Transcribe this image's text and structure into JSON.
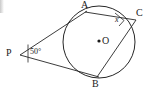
{
  "figure": {
    "type": "circle-geometry-tangent-inscribed-angle",
    "width": 145,
    "height": 92,
    "background": "#ffffff",
    "stroke_color": "#262626",
    "text_color": "#1a1a1a"
  },
  "labels": {
    "point_a": "A",
    "point_b": "B",
    "point_c": "C",
    "center_o": "O",
    "point_p": "P",
    "angle_p": "50°",
    "angle_c": "x"
  },
  "geometry": {
    "circle": {
      "cx": 99,
      "cy": 42,
      "r": 36
    },
    "points": {
      "A": {
        "x": 85,
        "y": 12
      },
      "B": {
        "x": 97,
        "y": 77
      },
      "C": {
        "x": 134,
        "y": 20
      },
      "O": {
        "x": 99,
        "y": 42
      },
      "P": {
        "x": 20,
        "y": 55
      }
    },
    "segments": [
      {
        "name": "tangent-p-to-a",
        "from": "P",
        "to": "A"
      },
      {
        "name": "tangent-p-to-b",
        "from": "P",
        "to": "B"
      },
      {
        "name": "chord-a-to-c",
        "from": "A",
        "to": "C"
      },
      {
        "name": "chord-b-to-c",
        "from": "B",
        "to": "C"
      }
    ],
    "angle_markers": [
      {
        "name": "angle-at-p",
        "vertex": "P",
        "value": "50°"
      },
      {
        "name": "angle-at-c",
        "vertex": "C",
        "value": "x"
      }
    ]
  },
  "label_positions": {
    "A": {
      "left": 81,
      "top": 0
    },
    "B": {
      "left": 92,
      "top": 79
    },
    "C": {
      "left": 136,
      "top": 8
    },
    "O": {
      "left": 103,
      "top": 36
    },
    "P": {
      "left": 6,
      "top": 48
    },
    "angle_p": {
      "left": 30,
      "top": 47
    },
    "angle_c": {
      "left": 116,
      "top": 16
    }
  }
}
